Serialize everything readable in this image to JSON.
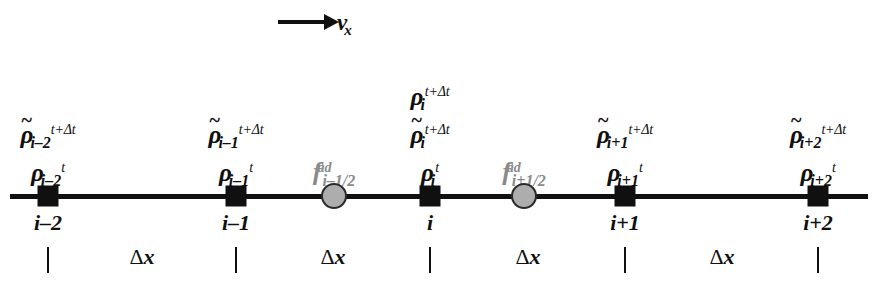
{
  "figure": {
    "velocity": {
      "label_base": "v",
      "label_sub": "x",
      "icon": "right-arrow-icon"
    },
    "rho_symbol": "ρ",
    "tilde_symbol": "~",
    "delta_symbol": "Δ",
    "superscript_new": "t+Δt",
    "superscript_old": "t",
    "flux_symbol": "f",
    "flux_superscript": "ad",
    "spacing_label": "Δx",
    "nodes": [
      {
        "id": "i-2",
        "index_label": "i–2",
        "x": 48,
        "marker": "square",
        "labels": [
          {
            "kind": "tilde-rho",
            "sub": "i–2",
            "sup": "t+Δt"
          },
          {
            "kind": "rho",
            "sub": "i–2",
            "sup": "t"
          }
        ]
      },
      {
        "id": "i-1",
        "index_label": "i–1",
        "x": 236,
        "marker": "square",
        "labels": [
          {
            "kind": "tilde-rho",
            "sub": "i–1",
            "sup": "t+Δt"
          },
          {
            "kind": "rho",
            "sub": "i–1",
            "sup": "t"
          }
        ]
      },
      {
        "id": "i",
        "index_label": "i",
        "x": 430,
        "marker": "square",
        "labels": [
          {
            "kind": "rho",
            "sub": "i",
            "sup": "t+Δt"
          },
          {
            "kind": "tilde-rho",
            "sub": "i",
            "sup": "t+Δt"
          },
          {
            "kind": "rho",
            "sub": "i",
            "sup": "t"
          }
        ]
      },
      {
        "id": "i+1",
        "index_label": "i+1",
        "x": 625,
        "marker": "square",
        "labels": [
          {
            "kind": "tilde-rho",
            "sub": "i+1",
            "sup": "t+Δt"
          },
          {
            "kind": "rho",
            "sub": "i+1",
            "sup": "t"
          }
        ]
      },
      {
        "id": "i+2",
        "index_label": "i+2",
        "x": 818,
        "marker": "square",
        "labels": [
          {
            "kind": "tilde-rho",
            "sub": "i+2",
            "sup": "t+Δt"
          },
          {
            "kind": "rho",
            "sub": "i+2",
            "sup": "t"
          }
        ]
      }
    ],
    "fluxes": [
      {
        "id": "i-1/2",
        "x": 334,
        "marker": "circle",
        "sub": "i–1/2",
        "sup": "ad"
      },
      {
        "id": "i+1/2",
        "x": 524,
        "marker": "circle",
        "sub": "i+1/2",
        "sup": "ad"
      }
    ],
    "spacings": [
      {
        "label": "Δx",
        "x": 142
      },
      {
        "label": "Δx",
        "x": 333
      },
      {
        "label": "Δx",
        "x": 528
      },
      {
        "label": "Δx",
        "x": 722
      }
    ],
    "colors": {
      "ink": "#101010",
      "flux_gray": "#8a8a8a",
      "circle_fill": "#adadad",
      "background": "#ffffff"
    }
  }
}
